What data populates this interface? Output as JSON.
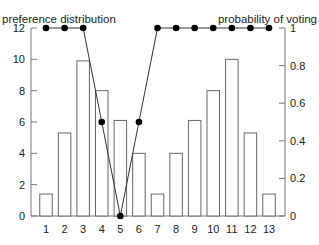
{
  "chart_data": {
    "type": "bar",
    "title_left": "preference distribution",
    "title_right": "probability of voting",
    "xlabel": "",
    "ylabel_left": "",
    "ylabel_right": "",
    "categories": [
      "1",
      "2",
      "3",
      "4",
      "5",
      "6",
      "7",
      "8",
      "9",
      "10",
      "11",
      "12",
      "13"
    ],
    "series": [
      {
        "name": "preference distribution",
        "type": "bar",
        "axis": "left",
        "values": [
          1.4,
          5.3,
          9.9,
          8.0,
          6.1,
          4.0,
          1.4,
          4.0,
          6.1,
          8.0,
          10.0,
          5.3,
          1.4
        ]
      },
      {
        "name": "probability of voting",
        "type": "line",
        "axis": "right",
        "markers": true,
        "values": [
          1,
          1,
          1,
          0.5,
          0,
          0.5,
          1,
          1,
          1,
          1,
          1,
          1,
          1
        ]
      }
    ],
    "ylim_left": [
      0,
      12
    ],
    "yticks_left": [
      "0",
      "2",
      "4",
      "6",
      "8",
      "10",
      "12"
    ],
    "ylim_right": [
      0,
      1
    ],
    "yticks_right": [
      "0",
      "0.2",
      "0.4",
      "0.6",
      "0.8",
      "1"
    ],
    "grid": false,
    "legend": "none"
  },
  "colors": {
    "axis": "#777777",
    "bar_edge": "#666666",
    "bar_fill": "#ffffff",
    "line": "#333333",
    "marker": "#000000",
    "text": "#222222"
  }
}
